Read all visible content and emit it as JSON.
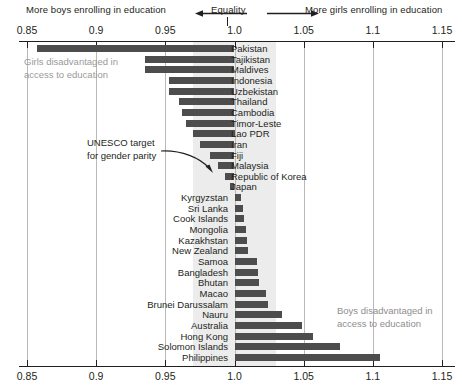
{
  "header": {
    "left_text": "More boys enrolling in education",
    "center_text": "Equality",
    "right_text": "More girls enrolling in education",
    "left_arrow_icon": "arrow-left-icon",
    "right_arrow_icon": "arrow-right-icon"
  },
  "annotations": {
    "girls_note_line1": "Girls disadvantaged in",
    "girls_note_line2": "access to education",
    "boys_note_line1": "Boys disadvantaged in",
    "boys_note_line2": "access to education",
    "unesco_line1": "UNESCO target",
    "unesco_line2": "for gender parity",
    "unesco_arrow_icon": "curved-arrow-icon"
  },
  "colors": {
    "bar": "#4d4d4d",
    "parity_band": "#ececec",
    "grid": "#b9b9b9",
    "axis": "#231f20",
    "note_gray": "#9a9a9a"
  },
  "chart_data": {
    "type": "bar",
    "orientation": "horizontal",
    "title": "",
    "xlabel": "",
    "ylabel": "",
    "xlim": [
      0.85,
      1.15
    ],
    "baseline": 1.0,
    "grid": true,
    "legend": "none",
    "tick_labels": [
      "0.85",
      "0.9",
      "0.95",
      "1.0",
      "1.05",
      "1.1",
      "1.15"
    ],
    "tick_values": [
      0.85,
      0.9,
      0.95,
      1.0,
      1.05,
      1.1,
      1.15
    ],
    "parity_band_range": [
      0.97,
      1.03
    ],
    "categories": [
      "Pakistan",
      "Tajikistan",
      "Maldives",
      "Indonesia",
      "Uzbekistan",
      "Thailand",
      "Cambodia",
      "Timor-Leste",
      "Lao PDR",
      "Iran",
      "Fiji",
      "Malaysia",
      "Republic of Korea",
      "Japan",
      "Kyrgyzstan",
      "Sri Lanka",
      "Cook Islands",
      "Mongolia",
      "Kazakhstan",
      "New Zealand",
      "Samoa",
      "Bangladesh",
      "Bhutan",
      "Macao",
      "Brunei Darussalam",
      "Nauru",
      "Australia",
      "Hong Kong",
      "Solomon Islands",
      "Philippines"
    ],
    "values": [
      0.857,
      0.935,
      0.935,
      0.953,
      0.953,
      0.96,
      0.962,
      0.965,
      0.97,
      0.975,
      0.982,
      0.988,
      0.993,
      0.997,
      1.005,
      1.006,
      1.007,
      1.008,
      1.009,
      1.01,
      1.016,
      1.017,
      1.018,
      1.023,
      1.024,
      1.034,
      1.049,
      1.057,
      1.076,
      1.105
    ]
  }
}
